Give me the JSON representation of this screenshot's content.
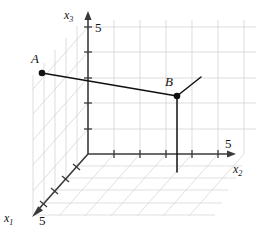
{
  "figure": {
    "background": "#ffffff",
    "width": 259,
    "height": 239
  },
  "axes": {
    "x1": {
      "label": "x",
      "subscript": "1",
      "tick_label": "5",
      "direction": "down-left",
      "axis_color": "#3a3a3a",
      "origin": [
        88,
        154
      ],
      "tip": [
        33,
        216
      ],
      "tick_count": 5
    },
    "x2": {
      "label": "x",
      "subscript": "2",
      "tick_label": "5",
      "direction": "right",
      "axis_color": "#3a3a3a",
      "origin": [
        88,
        154
      ],
      "tip": [
        236,
        154
      ],
      "tick_count": 5
    },
    "x3": {
      "label": "x",
      "subscript": "3",
      "tick_label": "5",
      "direction": "up",
      "axis_color": "#3a3a3a",
      "origin": [
        88,
        154
      ],
      "tip": [
        88,
        14
      ],
      "tick_count": 5
    }
  },
  "grid": {
    "color": "#c8c8cc",
    "floor_color": "#d0d0d4",
    "wall_color": "#cfcfd6",
    "spacing_x2": 26,
    "spacing_x3": 25.4,
    "spacing_x1": 14.6
  },
  "points": [
    {
      "name": "A",
      "label": "A",
      "px": [
        42,
        73
      ],
      "label_px": [
        31,
        57
      ],
      "dot_radius": 3.2,
      "color": "#111111"
    },
    {
      "name": "B",
      "label": "B",
      "px": [
        177,
        96
      ],
      "label_px": [
        166,
        79
      ],
      "dot_radius": 3.2,
      "color": "#111111"
    }
  ],
  "segments": [
    {
      "name": "segment-AB",
      "from": [
        42,
        73
      ],
      "to": [
        177,
        96
      ],
      "color": "#111111",
      "width": 1.5
    },
    {
      "name": "segment-B-depth",
      "from": [
        177,
        96
      ],
      "to": [
        201,
        77
      ],
      "color": "#111111",
      "width": 1.5
    },
    {
      "name": "segment-B-drop",
      "from": [
        177,
        96
      ],
      "to": [
        177,
        172
      ],
      "color": "#111111",
      "width": 1.5
    }
  ]
}
